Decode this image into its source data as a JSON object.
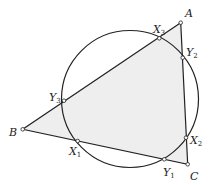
{
  "diagram": {
    "fill_color": "#eeeeee",
    "stroke_color": "#222222",
    "circle": {
      "cx": 130,
      "cy": 99,
      "r": 68.5
    },
    "triangle": {
      "A": {
        "x": 180.7,
        "y": 22.7
      },
      "B": {
        "x": 22.7,
        "y": 129.3
      },
      "C": {
        "x": 187.7,
        "y": 164.3
      }
    },
    "points": [
      {
        "id": "A",
        "name": "A",
        "sub": "",
        "x": 180.7,
        "y": 22.7,
        "lx": 185,
        "ly": 17
      },
      {
        "id": "B",
        "name": "B",
        "sub": "",
        "x": 22.7,
        "y": 129.3,
        "lx": 9,
        "ly": 136
      },
      {
        "id": "C",
        "name": "C",
        "sub": "",
        "x": 187.7,
        "y": 164.3,
        "lx": 190,
        "ly": 180
      },
      {
        "id": "X1",
        "name": "X",
        "sub": "1",
        "x": 77.7,
        "y": 141,
        "lx": 69,
        "ly": 155
      },
      {
        "id": "X2",
        "name": "X",
        "sub": "2",
        "x": 186,
        "y": 137.7,
        "lx": 190,
        "ly": 144
      },
      {
        "id": "X3",
        "name": "X",
        "sub": "3",
        "x": 159.3,
        "y": 38.3,
        "lx": 153,
        "ly": 33
      },
      {
        "id": "Y1",
        "name": "Y",
        "sub": "1",
        "x": 164.3,
        "y": 159.3,
        "lx": 163,
        "ly": 176
      },
      {
        "id": "Y2",
        "name": "Y",
        "sub": "2",
        "x": 182.7,
        "y": 57.7,
        "lx": 186,
        "ly": 56
      },
      {
        "id": "Y3",
        "name": "Y",
        "sub": "3",
        "x": 64,
        "y": 100.7,
        "lx": 49,
        "ly": 101
      }
    ]
  }
}
